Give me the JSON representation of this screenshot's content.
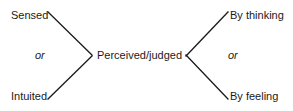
{
  "diagram": {
    "background_color": "#ffffff",
    "line_color": "#1a1a1a",
    "text_color": "#1a1a1a",
    "nodes": {
      "center": "Perceived/judged",
      "left_top": "Sensed",
      "left_bottom": "Intuited",
      "right_top": "By thinking",
      "right_bottom": "By feeling"
    },
    "connectors": {
      "left_or": "or",
      "right_or": "or"
    },
    "edges": [
      {
        "name": "sensed-to-center",
        "from": [
          48,
          12
        ],
        "to": [
          92,
          55
        ]
      },
      {
        "name": "intuited-to-center",
        "from": [
          48,
          99
        ],
        "to": [
          92,
          56
        ]
      },
      {
        "name": "center-to-bythinking",
        "from": [
          186,
          56
        ],
        "to": [
          228,
          12
        ]
      },
      {
        "name": "center-to-byfeeling",
        "from": [
          186,
          55
        ],
        "to": [
          228,
          99
        ]
      }
    ]
  }
}
